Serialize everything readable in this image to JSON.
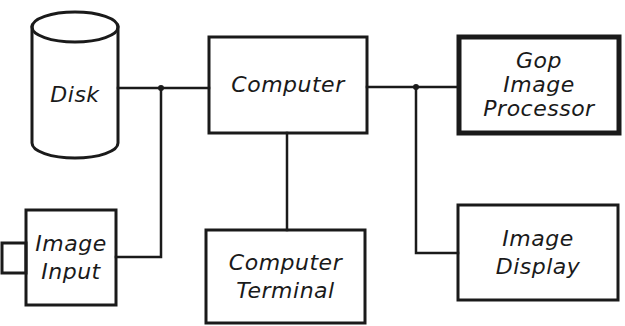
{
  "diagram": {
    "type": "block-diagram",
    "colors": {
      "line": "#1a1a1a",
      "background": "#ffffff"
    },
    "nodes": {
      "disk": {
        "shape": "cylinder",
        "lines": [
          "Disk"
        ]
      },
      "computer": {
        "shape": "box",
        "lines": [
          "Computer"
        ]
      },
      "gop": {
        "shape": "box-bold",
        "lines": [
          "Gop",
          "Image",
          "Processor"
        ]
      },
      "image_input": {
        "shape": "box-with-lens",
        "lines": [
          "Image",
          "Input"
        ]
      },
      "terminal": {
        "shape": "box",
        "lines": [
          "Computer",
          "Terminal"
        ]
      },
      "display": {
        "shape": "box",
        "lines": [
          "Image",
          "Display"
        ]
      }
    },
    "edges": [
      {
        "from": "disk",
        "to": "computer"
      },
      {
        "from": "image_input",
        "to": "computer",
        "via": "junction-left"
      },
      {
        "from": "computer",
        "to": "gop"
      },
      {
        "from": "computer",
        "to": "display",
        "via": "junction-right"
      },
      {
        "from": "computer",
        "to": "terminal"
      }
    ]
  }
}
